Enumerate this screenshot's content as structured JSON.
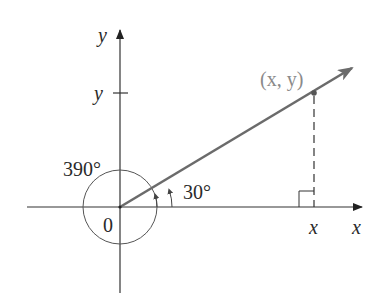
{
  "figure": {
    "type": "angle-diagram"
  },
  "axes": {
    "x_label": "x",
    "y_label": "y",
    "origin_label": "0"
  },
  "ticks": {
    "x_tick_label": "x",
    "y_tick_label": "y"
  },
  "point": {
    "label": "(x, y)"
  },
  "angles": [
    {
      "label": "30°",
      "degrees": 30
    },
    {
      "label": "390°",
      "degrees": 390
    }
  ],
  "colors": {
    "ray": "#6b6b6b",
    "axes": "#333333",
    "point_label": "#8a8a8a",
    "circle": "#555555"
  }
}
